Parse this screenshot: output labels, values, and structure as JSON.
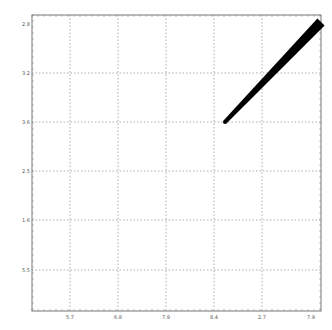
{
  "chart_data": {
    "type": "line",
    "title": "",
    "xlabel": "",
    "ylabel": "",
    "grid": true,
    "legend": null,
    "x_tick_labels": [
      "5.7",
      "6.8",
      "7.9",
      "8.4",
      "2.7",
      "7.9"
    ],
    "y_tick_labels": [
      "2.8",
      "3.2",
      "3.6",
      "2.5",
      "1.6",
      "5.5"
    ],
    "frame": {
      "left": 32,
      "top": 15,
      "right": 321,
      "bottom": 311
    },
    "x_gridlines_px": [
      70,
      118,
      166,
      214,
      262
    ],
    "y_gridlines_px": [
      73,
      122,
      171,
      220,
      270
    ],
    "x_tick_px": [
      70,
      118,
      166,
      214,
      262,
      311
    ],
    "y_tick_px": [
      24,
      73,
      122,
      171,
      220,
      270
    ],
    "series": [
      {
        "name": "series-1",
        "color": "#000000",
        "points_px": [
          [
            225,
            122
          ],
          [
            265,
            80
          ],
          [
            300,
            45
          ],
          [
            321,
            22
          ]
        ],
        "stroke_width_start": 4,
        "stroke_width_end": 10
      }
    ]
  }
}
